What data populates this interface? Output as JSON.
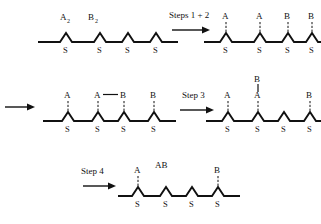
{
  "figure": {
    "background_color": "#ffffff",
    "ink_color": "#111111"
  },
  "labels": {
    "sulfur": "S",
    "group_a": "A",
    "group_b": "B",
    "reagent_a2": "A",
    "reagent_a2_sub": "2",
    "reagent_b2": "B",
    "reagent_b2_sub": "2",
    "product_ab": "AB"
  },
  "steps": {
    "step12": "Steps 1 + 2",
    "step3": "Step 3",
    "step4": "Step 4"
  },
  "rows": [
    {
      "name": "row-1",
      "left_panel": {
        "name": "substrate-initial",
        "reagents": [
          "A2",
          "B2"
        ],
        "sites": [
          {
            "index": 1,
            "s_label": "S",
            "attached": null
          },
          {
            "index": 2,
            "s_label": "S",
            "attached": null
          },
          {
            "index": 3,
            "s_label": "S",
            "attached": null
          },
          {
            "index": 4,
            "s_label": "S",
            "attached": null
          }
        ]
      },
      "arrow": {
        "name": "arrow-steps-1-2",
        "label": "Steps 1 + 2"
      },
      "right_panel": {
        "name": "substrate-after-steps-1-2",
        "sites": [
          {
            "index": 1,
            "s_label": "S",
            "attached": "A"
          },
          {
            "index": 2,
            "s_label": "S",
            "attached": "A"
          },
          {
            "index": 3,
            "s_label": "S",
            "attached": "B"
          },
          {
            "index": 4,
            "s_label": "S",
            "attached": "B"
          }
        ]
      }
    },
    {
      "name": "row-2",
      "continuation_arrow": {
        "name": "arrow-continuation",
        "label": ""
      },
      "left_panel": {
        "name": "substrate-with-ab-bond",
        "sites": [
          {
            "index": 1,
            "s_label": "S",
            "attached": "A"
          },
          {
            "index": 2,
            "s_label": "S",
            "attached": "A"
          },
          {
            "index": 3,
            "s_label": "S",
            "attached": "B"
          },
          {
            "index": 4,
            "s_label": "S",
            "attached": "B"
          }
        ],
        "bond": {
          "from_site": 2,
          "to_site": 3,
          "type": "horizontal",
          "between": [
            "A",
            "B"
          ]
        }
      },
      "arrow": {
        "name": "arrow-step-3",
        "label": "Step 3"
      },
      "right_panel": {
        "name": "substrate-after-step-3",
        "sites": [
          {
            "index": 1,
            "s_label": "S",
            "attached": "A"
          },
          {
            "index": 2,
            "s_label": "S",
            "attached": "A",
            "stacked_above": "B"
          },
          {
            "index": 3,
            "s_label": "S",
            "attached": null
          },
          {
            "index": 4,
            "s_label": "S",
            "attached": "B"
          }
        ]
      }
    },
    {
      "name": "row-3",
      "arrow": {
        "name": "arrow-step-4",
        "label": "Step 4"
      },
      "panel": {
        "name": "substrate-after-step-4",
        "released_product": "AB",
        "sites": [
          {
            "index": 1,
            "s_label": "S",
            "attached": "A"
          },
          {
            "index": 2,
            "s_label": "S",
            "attached": null
          },
          {
            "index": 3,
            "s_label": "S",
            "attached": null
          },
          {
            "index": 4,
            "s_label": "S",
            "attached": "B"
          }
        ]
      }
    }
  ]
}
